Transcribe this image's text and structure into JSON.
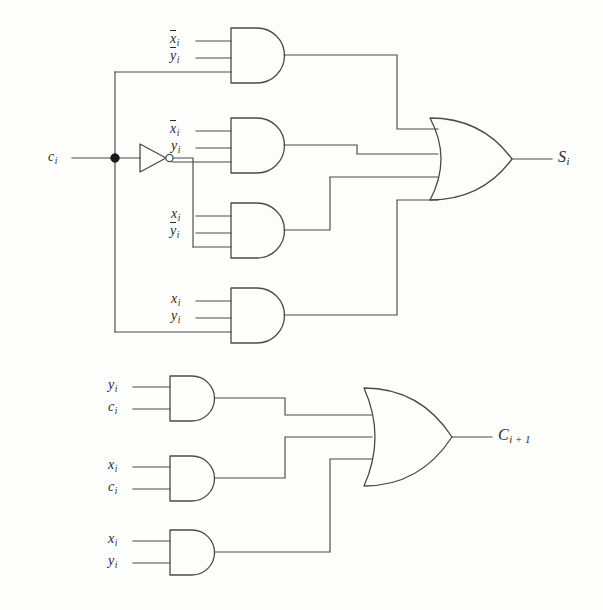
{
  "diagram": {
    "type": "logic-circuit",
    "line_color": "#4a4a4a",
    "background": "#fdfdfc"
  },
  "inputs": {
    "carry_in": {
      "base": "c",
      "sub": "i"
    }
  },
  "sum_section": {
    "output": {
      "base": "S",
      "sub": "i"
    },
    "or_gate_label": "OR",
    "and_gates": [
      {
        "id": "and-sum-1",
        "inputs": [
          {
            "base": "x",
            "sub": "i",
            "bar": true
          },
          {
            "base": "y",
            "sub": "i",
            "bar": true
          },
          {
            "base": "c",
            "sub": "i",
            "bar": false,
            "from_bus": true
          }
        ]
      },
      {
        "id": "and-sum-2",
        "inputs": [
          {
            "base": "x",
            "sub": "i",
            "bar": true
          },
          {
            "base": "y",
            "sub": "i",
            "bar": false
          },
          {
            "base": "c",
            "sub": "i",
            "bar": true,
            "from_bus": true
          }
        ]
      },
      {
        "id": "and-sum-3",
        "inputs": [
          {
            "base": "x",
            "sub": "i",
            "bar": false
          },
          {
            "base": "y",
            "sub": "i",
            "bar": true
          },
          {
            "base": "c",
            "sub": "i",
            "bar": true,
            "from_bus": true
          }
        ]
      },
      {
        "id": "and-sum-4",
        "inputs": [
          {
            "base": "x",
            "sub": "i",
            "bar": false
          },
          {
            "base": "y",
            "sub": "i",
            "bar": false
          },
          {
            "base": "c",
            "sub": "i",
            "bar": false,
            "from_bus": true
          }
        ]
      }
    ]
  },
  "carry_section": {
    "output": {
      "base": "C",
      "sub": "i + 1"
    },
    "or_gate_label": "OR",
    "and_gates": [
      {
        "id": "and-carry-1",
        "inputs": [
          {
            "base": "y",
            "sub": "i",
            "bar": false
          },
          {
            "base": "c",
            "sub": "i",
            "bar": false
          }
        ]
      },
      {
        "id": "and-carry-2",
        "inputs": [
          {
            "base": "x",
            "sub": "i",
            "bar": false
          },
          {
            "base": "c",
            "sub": "i",
            "bar": false
          }
        ]
      },
      {
        "id": "and-carry-3",
        "inputs": [
          {
            "base": "x",
            "sub": "i",
            "bar": false
          },
          {
            "base": "y",
            "sub": "i",
            "bar": false
          }
        ]
      }
    ]
  },
  "labels": {
    "sum_in_1_a": "x",
    "sum_in_1_b": "y",
    "sum_in_2_a": "x",
    "sum_in_2_b": "y",
    "sum_in_3_a": "x",
    "sum_in_3_b": "y",
    "sum_in_4_a": "x",
    "sum_in_4_b": "y",
    "carry_in_1_a": "y",
    "carry_in_1_b": "c",
    "carry_in_2_a": "x",
    "carry_in_2_b": "c",
    "carry_in_3_a": "x",
    "carry_in_3_b": "y",
    "ci": "c",
    "si": "S",
    "cout": "C",
    "sub_i": "i",
    "sub_ip1": "i + 1"
  }
}
